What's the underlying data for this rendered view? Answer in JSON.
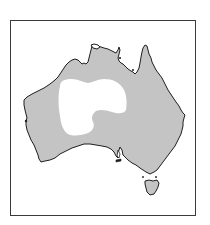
{
  "map": {
    "region": "Australia",
    "colors": {
      "background": "#ffffff",
      "frame": "#3a3a3a",
      "land_shaded": "#c4c4c4",
      "unshaded_interior": "#ffffff",
      "coastline": "#1e1e1e"
    },
    "legend": [],
    "labels": []
  }
}
